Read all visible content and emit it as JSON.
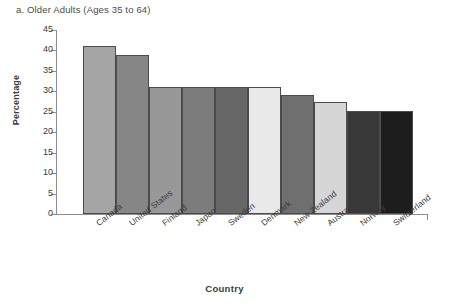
{
  "chart_data": {
    "type": "bar",
    "title": "a. Older Adults (Ages 35 to 64)",
    "xlabel": "Country",
    "ylabel": "Percentage",
    "categories": [
      "Canada",
      "United States",
      "Finland",
      "Japan",
      "Sweden",
      "Denmark",
      "New Zealand",
      "Australia",
      "Norway",
      "Switzerland"
    ],
    "values": [
      41,
      39,
      31,
      31,
      31,
      31,
      29,
      27.5,
      25.3,
      25.3
    ],
    "ylim": [
      0,
      45
    ],
    "ytick_step": 5,
    "yticks": [
      "45",
      "40",
      "35",
      "30",
      "25",
      "20",
      "15",
      "10",
      "5",
      "0"
    ],
    "grid": false,
    "legend": "none",
    "bar_colors": [
      "#a5a5a5",
      "#868686",
      "#989898",
      "#7c7c7c",
      "#676767",
      "#e9e9e9",
      "#6f6f6f",
      "#d6d6d6",
      "#383838",
      "#1d1d1d"
    ],
    "bar_outline_color": "#4b4b4b",
    "axis_color": "#8d8d8d",
    "text_color": "#3b3b3b",
    "background": "#ffffff"
  }
}
